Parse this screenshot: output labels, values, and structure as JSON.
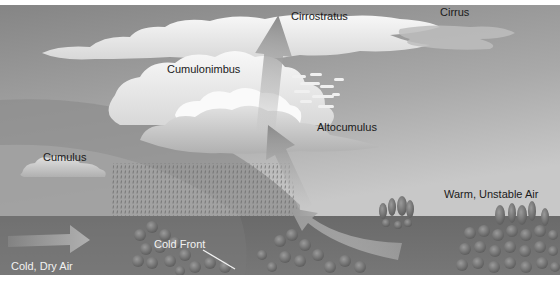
{
  "diagram": {
    "labels": {
      "cirrostratus": "Cirrostratus",
      "cirrus": "Cirrus",
      "cumulonimbus": "Cumulonimbus",
      "altocumulus": "Altocumulus",
      "cumulus": "Cumulus",
      "warm_air": "Warm, Unstable Air",
      "cold_front": "Cold Front",
      "cold_air": "Cold, Dry Air"
    },
    "colors": {
      "sky_top": "#8a8a8a",
      "sky_bottom": "#bdbdbd",
      "ground": "#6f6f6f",
      "cloud": "#f4f4f4",
      "cold_air_mass": "#9a9a9a",
      "arrow": "#a8a8a8",
      "trees": "#7d7d7d"
    }
  }
}
